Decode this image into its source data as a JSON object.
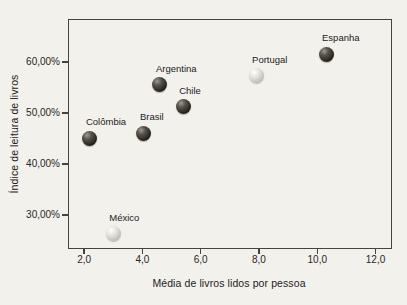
{
  "page": {
    "background": "#f3f1eb"
  },
  "chart_data": {
    "type": "scatter",
    "title": "",
    "xlabel": "Média de livros lidos por pessoa",
    "ylabel": "Índice de leitura de livros",
    "xlim": [
      1.48,
      12.53
    ],
    "ylim": [
      23.5,
      68.2
    ],
    "grid": false,
    "legend": "none",
    "x_ticks": [
      {
        "value": 2,
        "label": "2,0"
      },
      {
        "value": 4,
        "label": "4,0"
      },
      {
        "value": 6,
        "label": "6,0"
      },
      {
        "value": 8,
        "label": "8,0"
      },
      {
        "value": 10,
        "label": "10,0"
      },
      {
        "value": 12,
        "label": "12,0"
      }
    ],
    "y_ticks": [
      {
        "value": 30,
        "label": "30,00%"
      },
      {
        "value": 40,
        "label": "40,00%"
      },
      {
        "value": 50,
        "label": "50,00%"
      },
      {
        "value": 60,
        "label": "60,00%"
      }
    ],
    "points": [
      {
        "name": "Colômbia",
        "x": 2.2,
        "y": 45.0,
        "shade": "dark"
      },
      {
        "name": "México",
        "x": 3.0,
        "y": 26.3,
        "shade": "light"
      },
      {
        "name": "Brasil",
        "x": 4.05,
        "y": 46.0,
        "shade": "dark"
      },
      {
        "name": "Argentina",
        "x": 4.6,
        "y": 55.5,
        "shade": "dark"
      },
      {
        "name": "Chile",
        "x": 5.4,
        "y": 51.2,
        "shade": "dark"
      },
      {
        "name": "Portugal",
        "x": 7.9,
        "y": 57.3,
        "shade": "light"
      },
      {
        "name": "Espanha",
        "x": 10.3,
        "y": 61.5,
        "shade": "dark"
      }
    ],
    "colors": {
      "dark_ball": "#26241f",
      "light_ball": "#d8d5ce",
      "axis": "#45433f",
      "text": "#23211c"
    }
  }
}
